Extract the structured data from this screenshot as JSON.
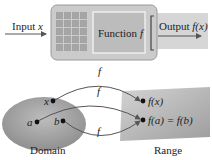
{
  "machine": {
    "input_label": "Input ",
    "input_var": "x",
    "function_label": "Function ",
    "function_var": "f",
    "output_label": "Output ",
    "output_var": "f(x)"
  },
  "mapping": {
    "domain_label": "Domain",
    "range_label": "Range",
    "domain_points": [
      "x",
      "a",
      "b"
    ],
    "range_points": [
      "f(x)",
      "f(a) = f(b)"
    ],
    "arrow_labels": [
      "f",
      "f",
      "f"
    ]
  },
  "colors": {
    "machine_body": "#c9c9c9",
    "keypad": "#a9a9a9",
    "screen": "#bdbdbd",
    "domain_fill": "#aaaaaa",
    "range_fill": "#b5b5b5",
    "arrow": "#555555"
  }
}
